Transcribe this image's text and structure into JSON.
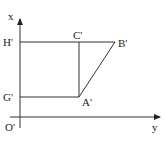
{
  "diagram": {
    "axes": {
      "vertical_label": "x",
      "horizontal_label": "y",
      "origin_label": "O'"
    },
    "points": {
      "H": "H'",
      "C": "C'",
      "B": "B'",
      "G": "G'",
      "A": "A'"
    },
    "colors": {
      "line": "#333333",
      "text": "#222222",
      "background": "#ffffff"
    }
  }
}
